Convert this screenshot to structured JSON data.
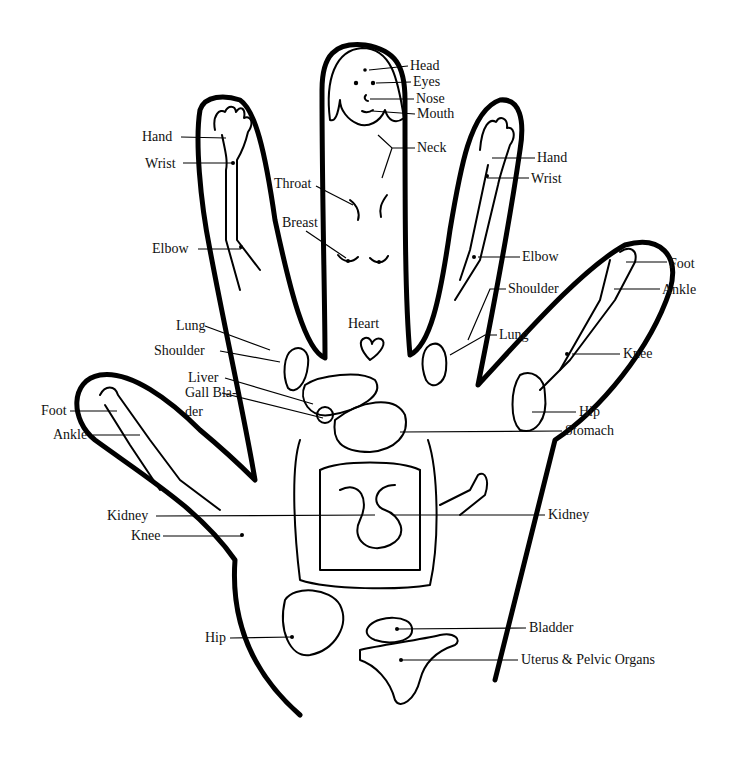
{
  "diagram": {
    "type": "hand-reflexology-map",
    "labels": [
      {
        "id": "head",
        "text": "Head",
        "x": 410,
        "y": 58
      },
      {
        "id": "eyes",
        "text": "Eyes",
        "x": 413,
        "y": 74
      },
      {
        "id": "nose",
        "text": "Nose",
        "x": 416,
        "y": 91
      },
      {
        "id": "mouth",
        "text": "Mouth",
        "x": 417,
        "y": 106
      },
      {
        "id": "neck",
        "text": "Neck",
        "x": 417,
        "y": 140
      },
      {
        "id": "throat",
        "text": "Throat",
        "x": 274,
        "y": 176
      },
      {
        "id": "breast",
        "text": "Breast",
        "x": 282,
        "y": 215
      },
      {
        "id": "hand-left",
        "text": "Hand",
        "x": 142,
        "y": 129
      },
      {
        "id": "wrist-left",
        "text": "Wrist",
        "x": 145,
        "y": 156
      },
      {
        "id": "elbow-left",
        "text": "Elbow",
        "x": 152,
        "y": 241
      },
      {
        "id": "hand-right",
        "text": "Hand",
        "x": 537,
        "y": 150
      },
      {
        "id": "wrist-right",
        "text": "Wrist",
        "x": 531,
        "y": 171
      },
      {
        "id": "elbow-right",
        "text": "Elbow",
        "x": 522,
        "y": 249
      },
      {
        "id": "heart",
        "text": "Heart",
        "x": 348,
        "y": 316
      },
      {
        "id": "lung-left",
        "text": "Lung",
        "x": 176,
        "y": 318
      },
      {
        "id": "shoulder-left",
        "text": "Shoulder",
        "x": 154,
        "y": 343
      },
      {
        "id": "shoulder-right",
        "text": "Shoulder",
        "x": 508,
        "y": 281
      },
      {
        "id": "lung-right",
        "text": "Lung",
        "x": 499,
        "y": 327
      },
      {
        "id": "foot-right",
        "text": "Foot",
        "x": 669,
        "y": 256
      },
      {
        "id": "ankle-right",
        "text": "Ankle",
        "x": 662,
        "y": 282
      },
      {
        "id": "knee-right",
        "text": "Knee",
        "x": 623,
        "y": 346
      },
      {
        "id": "hip-right",
        "text": "Hip",
        "x": 579,
        "y": 404
      },
      {
        "id": "stomach",
        "text": "Stomach",
        "x": 565,
        "y": 423
      },
      {
        "id": "liver",
        "text": "Liver",
        "x": 188,
        "y": 370
      },
      {
        "id": "gall-bladder",
        "text": "Gall Bla-",
        "x": 185,
        "y": 385
      },
      {
        "id": "gall-bladder-cont",
        "text": "der",
        "x": 185,
        "y": 404
      },
      {
        "id": "foot-left",
        "text": "Foot",
        "x": 41,
        "y": 403
      },
      {
        "id": "ankle-left",
        "text": "Ankle",
        "x": 53,
        "y": 427
      },
      {
        "id": "kidney-left",
        "text": "Kidney",
        "x": 107,
        "y": 508
      },
      {
        "id": "knee-left",
        "text": "Knee",
        "x": 131,
        "y": 528
      },
      {
        "id": "kidney-right",
        "text": "Kidney",
        "x": 548,
        "y": 507
      },
      {
        "id": "hip-left",
        "text": "Hip",
        "x": 205,
        "y": 630
      },
      {
        "id": "bladder",
        "text": "Bladder",
        "x": 529,
        "y": 620
      },
      {
        "id": "uterus",
        "text": "Uterus & Pelvic Organs",
        "x": 521,
        "y": 652
      }
    ]
  }
}
